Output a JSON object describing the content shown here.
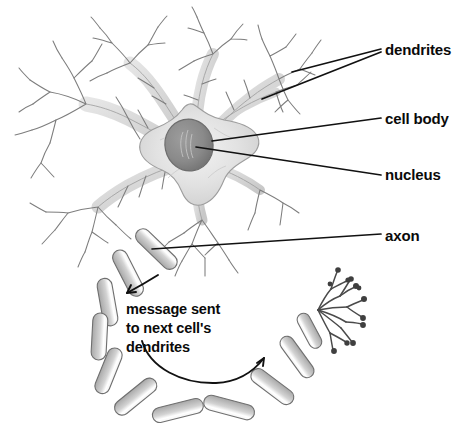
{
  "diagram": {
    "style": "grayscale pencil illustration with bold black labels",
    "background_color": "#ffffff",
    "label_color": "#0a0a0a",
    "leader_line_color": "#111111",
    "cell_fill_color": "#d9d9d9",
    "cell_outline_color": "#8f8f8f",
    "nucleus_fill_color": "#8a8a8a",
    "nucleus_outline_color": "#6d6d6d",
    "myelin_fill_color": "#d0d0d0",
    "myelin_outline_color": "#707070",
    "terminal_color": "#4a4a4a"
  },
  "labels": {
    "dendrites": "dendrites",
    "cell_body": "cell body",
    "nucleus": "nucleus",
    "axon": "axon",
    "message_line1": "message sent",
    "message_line2": "to next cell's",
    "message_line3": "dendrites"
  },
  "parts": [
    {
      "name": "dendrites",
      "label": "dendrites",
      "description": "branching tree-like extensions radiating from the cell body"
    },
    {
      "name": "cell-body",
      "label": "cell body",
      "description": "star-shaped soma at the center of the neuron"
    },
    {
      "name": "nucleus",
      "label": "nucleus",
      "description": "dark oval organelle inside the cell body"
    },
    {
      "name": "axon",
      "label": "axon",
      "description": "long myelinated fiber leaving the cell body in a looping curve"
    },
    {
      "name": "axon-terminals",
      "label": "",
      "description": "fan of fine branches ending in synaptic knobs"
    }
  ],
  "annotations": [
    {
      "name": "message-arrow-upper",
      "shape": "curved arrow pointing down-left toward the axon"
    },
    {
      "name": "message-arrow-lower",
      "shape": "curved arrow sweeping right toward the axon terminals"
    }
  ]
}
